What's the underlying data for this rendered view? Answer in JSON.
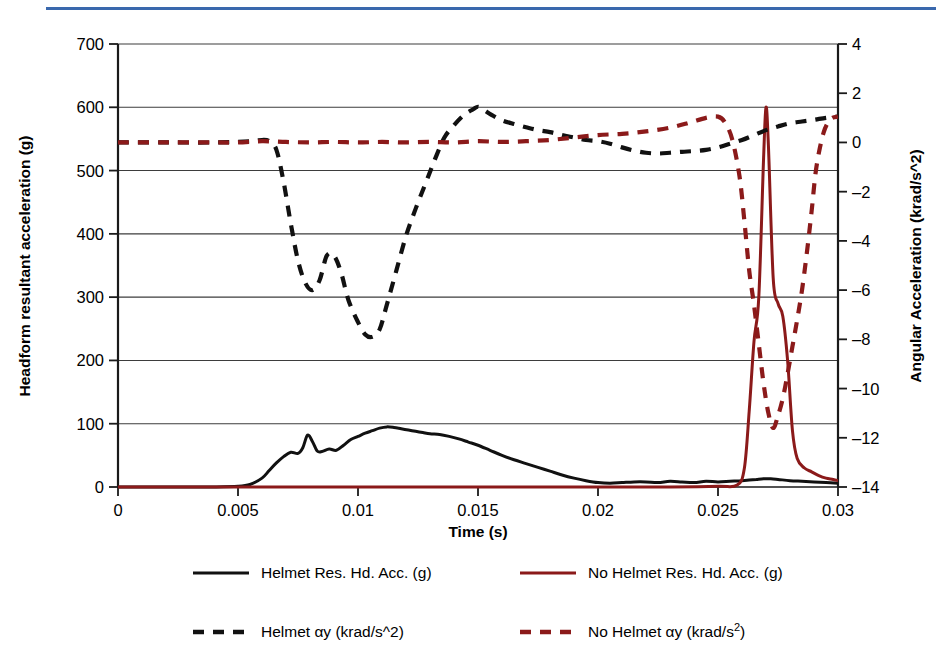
{
  "figure": {
    "top_rule_color": "#3a68ad"
  },
  "axes": {
    "x": {
      "label": "Time (s)",
      "ticks": [
        "0",
        "0.005",
        "0.01",
        "0.015",
        "0.02",
        "0.025",
        "0.03"
      ],
      "min": 0,
      "max": 0.03
    },
    "y_left": {
      "label": "Headform resultant acceleration (g)",
      "ticks": [
        "0",
        "100",
        "200",
        "300",
        "400",
        "500",
        "600",
        "700"
      ],
      "min": 0,
      "max": 700
    },
    "y_right": {
      "label": "Angular Acceleration (krad/s^2)",
      "ticks": [
        "–14",
        "–12",
        "–10",
        "–8",
        "–6",
        "–4",
        "–2",
        "0",
        "2",
        "4"
      ],
      "min": -14,
      "max": 4
    }
  },
  "legend": {
    "items": [
      {
        "label": "Helmet Res. Hd. Acc. (g)",
        "color": "#111111",
        "style": "solid"
      },
      {
        "label": "No Helmet Res. Hd. Acc. (g)",
        "color": "#8b1a1a",
        "style": "solid"
      },
      {
        "label": "Helmet αy (krad/s^2)",
        "color": "#111111",
        "style": "dashed"
      },
      {
        "label": "No Helmet αy (krad/s²)",
        "color": "#8b1a1a",
        "style": "dashed"
      }
    ]
  },
  "chart_data": {
    "type": "line",
    "title": "",
    "xlabel": "Time (s)",
    "ylabel": "Headform resultant acceleration (g)",
    "ylabel_secondary": "Angular Acceleration (krad/s^2)",
    "xlim": [
      0,
      0.03
    ],
    "ylim": [
      0,
      700
    ],
    "ylim_secondary": [
      -14,
      4
    ],
    "grid": true,
    "legend_position": "below",
    "series": [
      {
        "name": "Helmet Res. Hd. Acc. (g)",
        "axis": "left",
        "color": "#111111",
        "style": "solid",
        "x": [
          0,
          0.001,
          0.002,
          0.003,
          0.004,
          0.005,
          0.0055,
          0.006,
          0.0063,
          0.0066,
          0.0069,
          0.0072,
          0.0075,
          0.0077,
          0.0079,
          0.0081,
          0.0083,
          0.0085,
          0.0088,
          0.0091,
          0.0094,
          0.0097,
          0.01,
          0.0103,
          0.0106,
          0.0109,
          0.0112,
          0.0115,
          0.0118,
          0.0121,
          0.0124,
          0.0127,
          0.013,
          0.0134,
          0.0138,
          0.0142,
          0.0146,
          0.015,
          0.0155,
          0.016,
          0.0165,
          0.017,
          0.0175,
          0.018,
          0.0185,
          0.019,
          0.0195,
          0.02,
          0.0205,
          0.021,
          0.0215,
          0.022,
          0.0225,
          0.023,
          0.0235,
          0.024,
          0.0245,
          0.025,
          0.0255,
          0.026,
          0.0263,
          0.0266,
          0.0269,
          0.0272,
          0.0275,
          0.028,
          0.0285,
          0.029,
          0.0295,
          0.03
        ],
        "y": [
          0,
          0,
          0,
          0,
          0,
          1,
          4,
          14,
          26,
          38,
          48,
          55,
          53,
          62,
          82,
          72,
          57,
          56,
          60,
          58,
          66,
          75,
          80,
          85,
          89,
          93,
          95,
          94,
          92,
          90,
          88,
          86,
          84,
          83,
          80,
          76,
          71,
          66,
          58,
          50,
          43,
          37,
          31,
          25,
          19,
          14,
          10,
          7,
          6,
          7,
          8,
          8,
          7,
          9,
          8,
          7,
          9,
          8,
          9,
          10,
          11,
          12,
          13,
          13,
          12,
          10,
          9,
          8,
          7,
          6
        ]
      },
      {
        "name": "No Helmet Res. Hd. Acc. (g)",
        "axis": "left",
        "color": "#8b1a1a",
        "style": "solid",
        "x": [
          0,
          0.005,
          0.01,
          0.015,
          0.02,
          0.023,
          0.025,
          0.0258,
          0.0261,
          0.0263,
          0.0265,
          0.0267,
          0.0269,
          0.027,
          0.0271,
          0.0273,
          0.0275,
          0.0277,
          0.0279,
          0.0281,
          0.0283,
          0.0286,
          0.0289,
          0.0292,
          0.0295,
          0.0298,
          0.03
        ],
        "y": [
          0,
          0,
          0,
          0,
          0,
          0,
          1,
          3,
          30,
          120,
          230,
          300,
          520,
          600,
          540,
          330,
          290,
          270,
          200,
          90,
          45,
          30,
          24,
          18,
          14,
          12,
          10
        ]
      },
      {
        "name": "Helmet αy (krad/s^2)",
        "axis": "right",
        "color": "#111111",
        "style": "dashed",
        "x": [
          0,
          0.002,
          0.004,
          0.0055,
          0.006,
          0.0063,
          0.0066,
          0.0069,
          0.0072,
          0.0075,
          0.0078,
          0.0081,
          0.0084,
          0.0087,
          0.009,
          0.0093,
          0.0096,
          0.01,
          0.0103,
          0.0106,
          0.0109,
          0.0112,
          0.0116,
          0.012,
          0.0124,
          0.0128,
          0.0132,
          0.0136,
          0.014,
          0.0144,
          0.0148,
          0.015,
          0.0152,
          0.0156,
          0.016,
          0.0165,
          0.017,
          0.0175,
          0.018,
          0.0185,
          0.019,
          0.0195,
          0.02,
          0.0205,
          0.021,
          0.0215,
          0.022,
          0.0225,
          0.023,
          0.0235,
          0.024,
          0.0245,
          0.025,
          0.0255,
          0.026,
          0.0265,
          0.027,
          0.0275,
          0.028,
          0.0285,
          0.029,
          0.0295,
          0.03
        ],
        "y": [
          0,
          0,
          0,
          0.05,
          0.1,
          0.05,
          -0.3,
          -1.6,
          -3.3,
          -4.8,
          -5.7,
          -6.0,
          -5.6,
          -4.6,
          -4.6,
          -5.3,
          -6.4,
          -7.3,
          -7.8,
          -7.9,
          -7.6,
          -6.6,
          -5.2,
          -3.8,
          -2.7,
          -1.7,
          -0.7,
          0.2,
          0.7,
          1.1,
          1.35,
          1.45,
          1.35,
          1.1,
          0.9,
          0.75,
          0.62,
          0.5,
          0.42,
          0.3,
          0.2,
          0.1,
          0.05,
          -0.05,
          -0.2,
          -0.33,
          -0.42,
          -0.45,
          -0.42,
          -0.38,
          -0.35,
          -0.3,
          -0.2,
          -0.05,
          0.1,
          0.3,
          0.5,
          0.65,
          0.78,
          0.85,
          0.92,
          1.0,
          1.05
        ]
      },
      {
        "name": "No Helmet αy (krad/s²)",
        "axis": "right",
        "color": "#8b1a1a",
        "style": "dashed",
        "x": [
          0,
          0.002,
          0.004,
          0.005,
          0.006,
          0.007,
          0.008,
          0.009,
          0.01,
          0.011,
          0.012,
          0.013,
          0.014,
          0.015,
          0.016,
          0.017,
          0.018,
          0.019,
          0.02,
          0.021,
          0.022,
          0.023,
          0.0238,
          0.0245,
          0.025,
          0.0253,
          0.0256,
          0.0259,
          0.0261,
          0.0263,
          0.0265,
          0.0267,
          0.0269,
          0.0271,
          0.0273,
          0.0275,
          0.0277,
          0.0279,
          0.0281,
          0.0283,
          0.0285,
          0.0287,
          0.0289,
          0.0291,
          0.0294,
          0.0297,
          0.03
        ],
        "y": [
          0,
          0,
          0,
          0,
          0.05,
          0.02,
          0,
          0.02,
          0,
          0.02,
          0,
          0.02,
          0,
          0.05,
          0.02,
          0.05,
          0.1,
          0.2,
          0.3,
          0.35,
          0.45,
          0.6,
          0.8,
          1.0,
          1.05,
          0.8,
          0.1,
          -1.4,
          -3.2,
          -5.2,
          -6.6,
          -8.2,
          -9.8,
          -11.0,
          -11.6,
          -11.1,
          -10.4,
          -9.4,
          -8.3,
          -7.2,
          -6.0,
          -4.5,
          -2.8,
          -1.0,
          0.4,
          0.95,
          1.05
        ]
      }
    ]
  }
}
